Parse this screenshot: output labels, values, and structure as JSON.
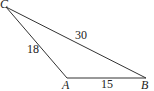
{
  "diagram": {
    "type": "triangle",
    "vertices": [
      {
        "name": "C",
        "x": 6,
        "y": 7
      },
      {
        "name": "A",
        "x": 67,
        "y": 78
      },
      {
        "name": "B",
        "x": 146,
        "y": 78
      }
    ],
    "sides": [
      {
        "from": "C",
        "to": "A",
        "label": "18"
      },
      {
        "from": "C",
        "to": "B",
        "label": "30"
      },
      {
        "from": "A",
        "to": "B",
        "label": "15"
      }
    ],
    "stroke_color": "#333333"
  }
}
